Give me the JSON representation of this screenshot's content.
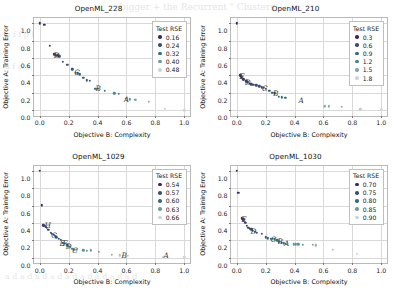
{
  "figure": {
    "xlabel": "Objective B: Complexity",
    "ylabel": "Objective A: Training Error",
    "legend_title": "Test RSE",
    "xticks": [
      "0.0",
      "0.2",
      "0.4",
      "0.6",
      "0.8",
      "1.0"
    ],
    "yticks": [
      "0.0",
      "0.2",
      "0.4",
      "0.6",
      "0.8",
      "1.0"
    ],
    "colors": {
      "dark": "#46325e",
      "mid": "#3d7b8c",
      "light": "#bfc9cc",
      "grid": "#d9d9d9",
      "axis": "#b9b9b9",
      "text": "#111111"
    }
  },
  "bleed_text": {
    "top": "bigger + the Recurrent \" Clusters",
    "line2": "p f f p f f f p f f p f f f p f f p",
    "line3": "a f a a f a a f f a a f a f a f a",
    "bottom": "a d a d a d a d a d a  d a d a d a d"
  },
  "chart_data": [
    {
      "type": "scatter",
      "title": "OpenML_228",
      "xlabel": "Objective B: Complexity",
      "ylabel": "Objective A: Training Error",
      "xlim": [
        -0.04,
        1.04
      ],
      "ylim": [
        -0.06,
        1.06
      ],
      "grid": true,
      "legend_position": "upper right",
      "colorbar_label": "Test RSE",
      "legend_entries": [
        "0.16",
        "0.24",
        "0.32",
        "0.40",
        "0.48"
      ],
      "legend_values": [
        0.16,
        0.24,
        0.32,
        0.4,
        0.48
      ],
      "points": [
        {
          "x": 0.0,
          "y": 1.0,
          "c": 0.17
        },
        {
          "x": 0.03,
          "y": 0.98,
          "c": 0.18
        },
        {
          "x": 0.07,
          "y": 0.74,
          "c": 0.2
        },
        {
          "x": 0.1,
          "y": 0.645,
          "c": 0.21
        },
        {
          "x": 0.11,
          "y": 0.635,
          "c": 0.21
        },
        {
          "x": 0.115,
          "y": 0.625,
          "c": 0.22
        },
        {
          "x": 0.125,
          "y": 0.63,
          "c": 0.22
        },
        {
          "x": 0.135,
          "y": 0.62,
          "c": 0.22
        },
        {
          "x": 0.16,
          "y": 0.56,
          "c": 0.23
        },
        {
          "x": 0.19,
          "y": 0.525,
          "c": 0.24
        },
        {
          "x": 0.225,
          "y": 0.47,
          "c": 0.25
        },
        {
          "x": 0.25,
          "y": 0.43,
          "c": 0.26
        },
        {
          "x": 0.265,
          "y": 0.425,
          "c": 0.26
        },
        {
          "x": 0.275,
          "y": 0.415,
          "c": 0.27
        },
        {
          "x": 0.3,
          "y": 0.37,
          "c": 0.28
        },
        {
          "x": 0.325,
          "y": 0.345,
          "c": 0.29
        },
        {
          "x": 0.345,
          "y": 0.34,
          "c": 0.29
        },
        {
          "x": 0.385,
          "y": 0.245,
          "c": 0.32
        },
        {
          "x": 0.4,
          "y": 0.25,
          "c": 0.32
        },
        {
          "x": 0.45,
          "y": 0.225,
          "c": 0.34
        },
        {
          "x": 0.515,
          "y": 0.195,
          "c": 0.36
        },
        {
          "x": 0.545,
          "y": 0.19,
          "c": 0.36
        },
        {
          "x": 0.595,
          "y": 0.135,
          "c": 0.38
        },
        {
          "x": 0.625,
          "y": 0.125,
          "c": 0.39
        },
        {
          "x": 0.66,
          "y": 0.12,
          "c": 0.4
        },
        {
          "x": 0.755,
          "y": 0.1,
          "c": 0.43
        },
        {
          "x": 0.865,
          "y": 0.02,
          "c": 0.47
        },
        {
          "x": 1.0,
          "y": 0.0,
          "c": 0.49
        }
      ],
      "annotations": [
        {
          "label": "A",
          "x": 0.6,
          "y": 0.135
        },
        {
          "label": "B",
          "x": 0.405,
          "y": 0.255
        },
        {
          "label": "C",
          "x": 0.258,
          "y": 0.435
        },
        {
          "label": "D",
          "x": 0.118,
          "y": 0.635
        }
      ]
    },
    {
      "type": "scatter",
      "title": "OpenML_210",
      "xlabel": "Objective B: Complexity",
      "ylabel": "Objective A: Training Error",
      "xlim": [
        -0.04,
        1.04
      ],
      "ylim": [
        -0.06,
        1.06
      ],
      "grid": true,
      "legend_position": "upper right",
      "colorbar_label": "Test RSE",
      "legend_entries": [
        "0.3",
        "0.6",
        "0.9",
        "1.2",
        "1.5",
        "1.8"
      ],
      "legend_values": [
        0.3,
        0.6,
        0.9,
        1.2,
        1.5,
        1.8
      ],
      "points": [
        {
          "x": 0.0,
          "y": 1.0,
          "c": 0.35
        },
        {
          "x": 0.025,
          "y": 0.4,
          "c": 0.45
        },
        {
          "x": 0.03,
          "y": 0.385,
          "c": 0.45
        },
        {
          "x": 0.035,
          "y": 0.37,
          "c": 0.46
        },
        {
          "x": 0.045,
          "y": 0.355,
          "c": 0.47
        },
        {
          "x": 0.05,
          "y": 0.35,
          "c": 0.47
        },
        {
          "x": 0.065,
          "y": 0.335,
          "c": 0.5
        },
        {
          "x": 0.075,
          "y": 0.32,
          "c": 0.52
        },
        {
          "x": 0.09,
          "y": 0.305,
          "c": 0.55
        },
        {
          "x": 0.1,
          "y": 0.3,
          "c": 0.57
        },
        {
          "x": 0.115,
          "y": 0.29,
          "c": 0.6
        },
        {
          "x": 0.135,
          "y": 0.285,
          "c": 0.62
        },
        {
          "x": 0.155,
          "y": 0.275,
          "c": 0.65
        },
        {
          "x": 0.175,
          "y": 0.265,
          "c": 0.68
        },
        {
          "x": 0.185,
          "y": 0.255,
          "c": 0.7
        },
        {
          "x": 0.2,
          "y": 0.25,
          "c": 0.72
        },
        {
          "x": 0.225,
          "y": 0.225,
          "c": 0.78
        },
        {
          "x": 0.245,
          "y": 0.2,
          "c": 0.82
        },
        {
          "x": 0.265,
          "y": 0.195,
          "c": 0.86
        },
        {
          "x": 0.29,
          "y": 0.155,
          "c": 0.95
        },
        {
          "x": 0.31,
          "y": 0.15,
          "c": 1.0
        },
        {
          "x": 0.335,
          "y": 0.145,
          "c": 1.05
        },
        {
          "x": 0.61,
          "y": 0.045,
          "c": 1.5
        },
        {
          "x": 0.635,
          "y": 0.045,
          "c": 1.55
        },
        {
          "x": 0.725,
          "y": 0.04,
          "c": 1.62
        },
        {
          "x": 0.855,
          "y": 0.01,
          "c": 1.75
        },
        {
          "x": 1.0,
          "y": 0.005,
          "c": 1.82
        }
      ],
      "annotations": [
        {
          "label": "A",
          "x": 0.445,
          "y": 0.115
        },
        {
          "label": "B",
          "x": 0.27,
          "y": 0.195
        },
        {
          "label": "C",
          "x": 0.195,
          "y": 0.255
        },
        {
          "label": "D",
          "x": 0.075,
          "y": 0.325
        },
        {
          "label": "E",
          "x": 0.035,
          "y": 0.395
        }
      ]
    },
    {
      "type": "scatter",
      "title": "OpenML_1029",
      "xlabel": "Objective B: Complexity",
      "ylabel": "Objective A: Training Error",
      "xlim": [
        -0.04,
        1.04
      ],
      "ylim": [
        -0.06,
        1.06
      ],
      "grid": true,
      "legend_position": "upper right",
      "colorbar_label": "Test RSE",
      "legend_entries": [
        "0.54",
        "0.57",
        "0.60",
        "0.63",
        "0.66"
      ],
      "legend_values": [
        0.54,
        0.57,
        0.6,
        0.63,
        0.66
      ],
      "points": [
        {
          "x": 0.0,
          "y": 1.0,
          "c": 0.545
        },
        {
          "x": 0.015,
          "y": 0.605,
          "c": 0.55
        },
        {
          "x": 0.025,
          "y": 0.375,
          "c": 0.555
        },
        {
          "x": 0.03,
          "y": 0.365,
          "c": 0.555
        },
        {
          "x": 0.04,
          "y": 0.355,
          "c": 0.558
        },
        {
          "x": 0.05,
          "y": 0.345,
          "c": 0.56
        },
        {
          "x": 0.06,
          "y": 0.32,
          "c": 0.565
        },
        {
          "x": 0.075,
          "y": 0.29,
          "c": 0.57
        },
        {
          "x": 0.085,
          "y": 0.275,
          "c": 0.572
        },
        {
          "x": 0.095,
          "y": 0.265,
          "c": 0.575
        },
        {
          "x": 0.105,
          "y": 0.25,
          "c": 0.578
        },
        {
          "x": 0.115,
          "y": 0.235,
          "c": 0.58
        },
        {
          "x": 0.13,
          "y": 0.22,
          "c": 0.585
        },
        {
          "x": 0.145,
          "y": 0.205,
          "c": 0.59
        },
        {
          "x": 0.16,
          "y": 0.175,
          "c": 0.595
        },
        {
          "x": 0.175,
          "y": 0.16,
          "c": 0.6
        },
        {
          "x": 0.19,
          "y": 0.145,
          "c": 0.605
        },
        {
          "x": 0.205,
          "y": 0.125,
          "c": 0.61
        },
        {
          "x": 0.225,
          "y": 0.105,
          "c": 0.615
        },
        {
          "x": 0.24,
          "y": 0.095,
          "c": 0.618
        },
        {
          "x": 0.255,
          "y": 0.09,
          "c": 0.62
        },
        {
          "x": 0.3,
          "y": 0.085,
          "c": 0.625
        },
        {
          "x": 0.325,
          "y": 0.08,
          "c": 0.628
        },
        {
          "x": 0.355,
          "y": 0.085,
          "c": 0.63
        },
        {
          "x": 0.41,
          "y": 0.07,
          "c": 0.635
        },
        {
          "x": 0.5,
          "y": 0.035,
          "c": 0.645
        },
        {
          "x": 0.555,
          "y": 0.03,
          "c": 0.65
        },
        {
          "x": 0.575,
          "y": 0.025,
          "c": 0.652
        },
        {
          "x": 0.61,
          "y": 0.025,
          "c": 0.655
        },
        {
          "x": 0.855,
          "y": 0.01,
          "c": 0.662
        },
        {
          "x": 1.0,
          "y": 0.005,
          "c": 0.665
        }
      ],
      "annotations": [
        {
          "label": "A",
          "x": 0.875,
          "y": 0.03
        },
        {
          "label": "B",
          "x": 0.585,
          "y": 0.03
        },
        {
          "label": "C",
          "x": 0.245,
          "y": 0.095
        },
        {
          "label": "D",
          "x": 0.2,
          "y": 0.135
        },
        {
          "label": "E",
          "x": 0.155,
          "y": 0.175
        },
        {
          "label": "F",
          "x": 0.175,
          "y": 0.165
        },
        {
          "label": "G",
          "x": 0.1,
          "y": 0.26
        },
        {
          "label": "H",
          "x": 0.055,
          "y": 0.375
        }
      ]
    },
    {
      "type": "scatter",
      "title": "OpenML_1030",
      "xlabel": "Objective B: Complexity",
      "ylabel": "Objective A: Training Error",
      "xlim": [
        -0.04,
        1.04
      ],
      "ylim": [
        -0.06,
        1.06
      ],
      "grid": true,
      "legend_position": "upper right",
      "colorbar_label": "Test RSE",
      "legend_entries": [
        "0.70",
        "0.75",
        "0.80",
        "0.85",
        "0.90"
      ],
      "legend_values": [
        0.7,
        0.75,
        0.8,
        0.85,
        0.9
      ],
      "points": [
        {
          "x": 0.0,
          "y": 1.0,
          "c": 0.7
        },
        {
          "x": 0.01,
          "y": 0.745,
          "c": 0.705
        },
        {
          "x": 0.035,
          "y": 0.455,
          "c": 0.715
        },
        {
          "x": 0.045,
          "y": 0.44,
          "c": 0.718
        },
        {
          "x": 0.05,
          "y": 0.425,
          "c": 0.72
        },
        {
          "x": 0.06,
          "y": 0.4,
          "c": 0.725
        },
        {
          "x": 0.07,
          "y": 0.365,
          "c": 0.73
        },
        {
          "x": 0.08,
          "y": 0.345,
          "c": 0.735
        },
        {
          "x": 0.09,
          "y": 0.335,
          "c": 0.738
        },
        {
          "x": 0.1,
          "y": 0.325,
          "c": 0.74
        },
        {
          "x": 0.11,
          "y": 0.31,
          "c": 0.745
        },
        {
          "x": 0.125,
          "y": 0.3,
          "c": 0.75
        },
        {
          "x": 0.14,
          "y": 0.29,
          "c": 0.755
        },
        {
          "x": 0.175,
          "y": 0.275,
          "c": 0.765
        },
        {
          "x": 0.2,
          "y": 0.235,
          "c": 0.775
        },
        {
          "x": 0.215,
          "y": 0.225,
          "c": 0.78
        },
        {
          "x": 0.235,
          "y": 0.22,
          "c": 0.785
        },
        {
          "x": 0.25,
          "y": 0.215,
          "c": 0.79
        },
        {
          "x": 0.265,
          "y": 0.21,
          "c": 0.795
        },
        {
          "x": 0.28,
          "y": 0.2,
          "c": 0.8
        },
        {
          "x": 0.295,
          "y": 0.185,
          "c": 0.805
        },
        {
          "x": 0.31,
          "y": 0.175,
          "c": 0.81
        },
        {
          "x": 0.325,
          "y": 0.165,
          "c": 0.815
        },
        {
          "x": 0.34,
          "y": 0.16,
          "c": 0.82
        },
        {
          "x": 0.395,
          "y": 0.155,
          "c": 0.835
        },
        {
          "x": 0.41,
          "y": 0.155,
          "c": 0.838
        },
        {
          "x": 0.425,
          "y": 0.155,
          "c": 0.84
        },
        {
          "x": 0.455,
          "y": 0.15,
          "c": 0.848
        },
        {
          "x": 0.525,
          "y": 0.15,
          "c": 0.86
        },
        {
          "x": 0.545,
          "y": 0.145,
          "c": 0.865
        },
        {
          "x": 0.665,
          "y": 0.095,
          "c": 0.885
        },
        {
          "x": 0.83,
          "y": 0.045,
          "c": 0.9
        }
      ],
      "annotations": [
        {
          "label": "A",
          "x": 0.345,
          "y": 0.175
        },
        {
          "label": "B",
          "x": 0.3,
          "y": 0.195
        },
        {
          "label": "C",
          "x": 0.255,
          "y": 0.21
        },
        {
          "label": "D",
          "x": 0.115,
          "y": 0.31
        },
        {
          "label": "E",
          "x": 0.05,
          "y": 0.45
        }
      ]
    }
  ]
}
